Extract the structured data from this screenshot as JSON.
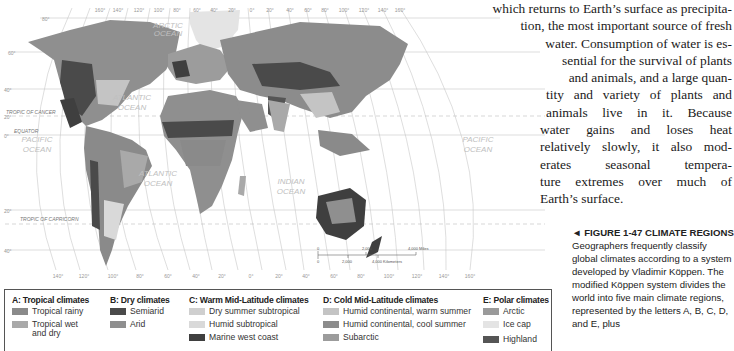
{
  "body_text": {
    "lines": [
      "which returns to Earth’s surface as precipita-",
      "tion, the most important source of fresh",
      "water. Consumption of water is es-",
      "sential for the survival of plants",
      "and animals, and a large quan-",
      "tity and variety of plants and",
      "animals live in it. Because",
      "water gains and loses heat",
      "relatively slowly, it also mod-",
      "erates seasonal tempera-",
      "ture extremes over much of",
      "Earth’s surface."
    ]
  },
  "caption": {
    "marker": "◄",
    "figure_label": "FIGURE 1-47 CLIMATE REGIONS",
    "text": "Geographers frequently classify global climates according to a system developed by Vladimir Köppen. The modified Köppen system divides the world into five main climate regions, represented by the letters A, B, C, D, and E, plus"
  },
  "map": {
    "ocean_labels": {
      "arctic": [
        "ARCTIC",
        "OCEAN"
      ],
      "atlantic_north": [
        "ATLANTIC",
        "OCEAN"
      ],
      "atlantic_south": [
        "ATLANTIC",
        "OCEAN"
      ],
      "pacific_west": [
        "PACIFIC",
        "OCEAN"
      ],
      "pacific_east": [
        "PACIFIC",
        "OCEAN"
      ],
      "indian": [
        "INDIAN",
        "OCEAN"
      ]
    },
    "line_labels": {
      "tropic_cancer": "TROPIC OF CANCER",
      "equator": "EQUATOR",
      "tropic_capricorn": "TROPIC OF CAPRICORN"
    },
    "lat_labels": [
      "80°",
      "60°",
      "40°",
      "20°",
      "0°",
      "20°",
      "40°"
    ],
    "top_lon_labels": [
      "160°",
      "140°",
      "120°",
      "100°",
      "80°",
      "60°",
      "40°",
      "20°",
      "0°",
      "20°",
      "40°",
      "60°",
      "80°",
      "100°",
      "120°",
      "140°",
      "160°"
    ],
    "bottom_lon_labels": [
      "140°",
      "120°",
      "100°",
      "80°",
      "60°",
      "40°",
      "20°",
      "0°",
      "20°",
      "40°",
      "60°",
      "80°",
      "100°",
      "120°",
      "140°",
      "160°"
    ],
    "scale": {
      "miles_0": "0",
      "miles_mid": "2,000",
      "miles_end": "4,000 Miles",
      "km_0": "0",
      "km_mid": "2,000",
      "km_end": "4,000 Kilometers"
    }
  },
  "legend": {
    "groups": [
      {
        "heading": "A: Tropical climates",
        "items": [
          {
            "label": "Tropical rainy",
            "color": "#8a8a8a"
          },
          {
            "label": "Tropical wet and dry",
            "color": "#a9a9a9"
          }
        ]
      },
      {
        "heading": "B: Dry climates",
        "items": [
          {
            "label": "Semiarid",
            "color": "#4a4a4a"
          },
          {
            "label": "Arid",
            "color": "#8f8f8f"
          }
        ]
      },
      {
        "heading": "C: Warm Mid-Latitude climates",
        "items": [
          {
            "label": "Dry summer subtropical",
            "color": "#cfcfcf"
          },
          {
            "label": "Humid subtropical",
            "color": "#d9d9d9"
          },
          {
            "label": "Marine west coast",
            "color": "#3f3f3f"
          }
        ]
      },
      {
        "heading": "D: Cold Mid-Latitude climates",
        "items": [
          {
            "label": "Humid continental, warm summer",
            "color": "#c4c4c4"
          },
          {
            "label": "Humid continental, cool summer",
            "color": "#8c8c8c"
          },
          {
            "label": "Subarctic",
            "color": "#9c9c9c"
          }
        ]
      },
      {
        "heading": "E: Polar climates",
        "items": [
          {
            "label": "Arctic",
            "color": "#9a9a9a"
          },
          {
            "label": "Ice cap",
            "color": "#e4e4e4"
          },
          {
            "label": "Highland",
            "color": "#555555"
          }
        ]
      }
    ]
  }
}
